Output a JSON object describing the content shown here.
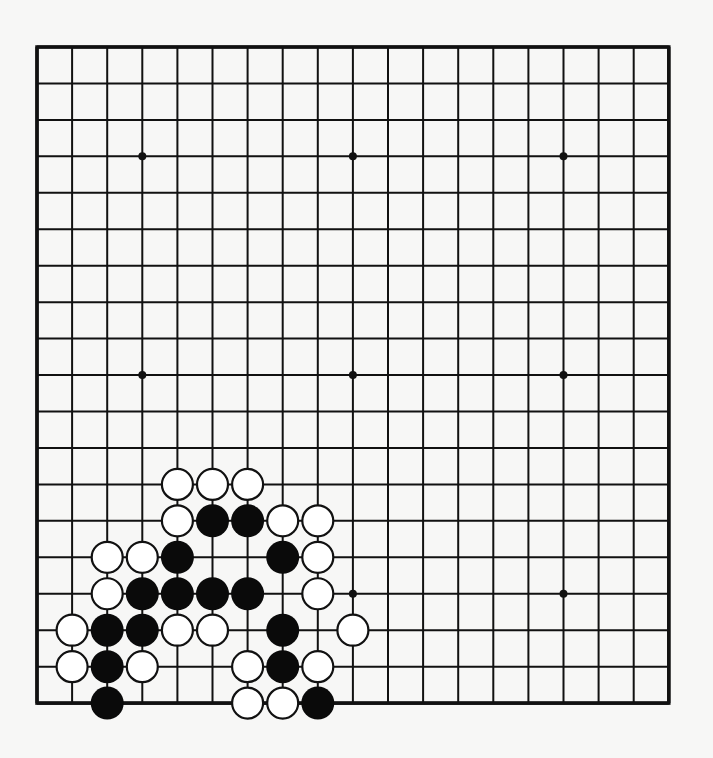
{
  "board": {
    "size": 19,
    "origin_x": 37,
    "origin_y": 47,
    "step_x": 35.1,
    "step_y": 36.45,
    "stone_radius": 16.5,
    "colors": {
      "line": "#111111",
      "black": "#0a0a0a",
      "white": "#ffffff",
      "background": "#f7f7f6"
    },
    "star_points": [
      [
        3,
        3
      ],
      [
        9,
        3
      ],
      [
        15,
        3
      ],
      [
        3,
        9
      ],
      [
        9,
        9
      ],
      [
        15,
        9
      ],
      [
        3,
        15
      ],
      [
        9,
        15
      ],
      [
        15,
        15
      ]
    ],
    "stones": [
      {
        "c": "W",
        "col": 4,
        "row": 12
      },
      {
        "c": "W",
        "col": 5,
        "row": 12
      },
      {
        "c": "W",
        "col": 6,
        "row": 12
      },
      {
        "c": "W",
        "col": 4,
        "row": 13
      },
      {
        "c": "B",
        "col": 5,
        "row": 13
      },
      {
        "c": "B",
        "col": 6,
        "row": 13
      },
      {
        "c": "W",
        "col": 7,
        "row": 13
      },
      {
        "c": "W",
        "col": 8,
        "row": 13
      },
      {
        "c": "W",
        "col": 2,
        "row": 14
      },
      {
        "c": "W",
        "col": 3,
        "row": 14
      },
      {
        "c": "B",
        "col": 4,
        "row": 14
      },
      {
        "c": "B",
        "col": 7,
        "row": 14
      },
      {
        "c": "W",
        "col": 8,
        "row": 14
      },
      {
        "c": "W",
        "col": 2,
        "row": 15
      },
      {
        "c": "B",
        "col": 3,
        "row": 15
      },
      {
        "c": "B",
        "col": 4,
        "row": 15
      },
      {
        "c": "B",
        "col": 5,
        "row": 15
      },
      {
        "c": "B",
        "col": 6,
        "row": 15
      },
      {
        "c": "W",
        "col": 8,
        "row": 15
      },
      {
        "c": "W",
        "col": 1,
        "row": 16
      },
      {
        "c": "B",
        "col": 2,
        "row": 16
      },
      {
        "c": "B",
        "col": 3,
        "row": 16
      },
      {
        "c": "W",
        "col": 4,
        "row": 16
      },
      {
        "c": "W",
        "col": 5,
        "row": 16
      },
      {
        "c": "B",
        "col": 7,
        "row": 16
      },
      {
        "c": "W",
        "col": 9,
        "row": 16
      },
      {
        "c": "W",
        "col": 1,
        "row": 17
      },
      {
        "c": "B",
        "col": 2,
        "row": 17
      },
      {
        "c": "W",
        "col": 3,
        "row": 17
      },
      {
        "c": "W",
        "col": 6,
        "row": 17
      },
      {
        "c": "B",
        "col": 7,
        "row": 17
      },
      {
        "c": "W",
        "col": 8,
        "row": 17
      },
      {
        "c": "B",
        "col": 2,
        "row": 18
      },
      {
        "c": "W",
        "col": 6,
        "row": 18
      },
      {
        "c": "W",
        "col": 7,
        "row": 18
      },
      {
        "c": "B",
        "col": 8,
        "row": 18
      }
    ]
  }
}
